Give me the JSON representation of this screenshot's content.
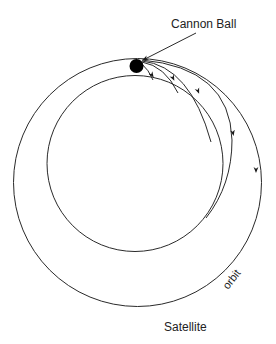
{
  "diagram": {
    "title_label": "Cannon Ball",
    "bottom_label": "Satellite",
    "orbit_label": "orbit",
    "colors": {
      "stroke": "#2a2a2a",
      "ball": "#000000",
      "background": "#ffffff"
    },
    "elements": {
      "earth": "inner circle (planet surface)",
      "orbit": "outer circle (satellite orbit)",
      "cannon_ball": "black filled circle at top",
      "trajectories": 4
    }
  }
}
